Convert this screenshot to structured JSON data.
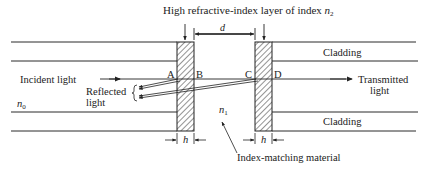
{
  "diagram": {
    "title_label": "High refractive-index layer of index",
    "title_sub_var": "n",
    "title_sub_idx": "2",
    "gap_label": "d",
    "point_labels": {
      "a": "A",
      "b": "B",
      "c": "C",
      "d": "D"
    },
    "incident_label": "Incident light",
    "reflected_label_1": "Reflected",
    "reflected_label_2": "light",
    "transmitted_label_1": "Transmitted",
    "transmitted_label_2": "light",
    "cladding_top": "Cladding",
    "cladding_bottom": "Cladding",
    "n0_var": "n",
    "n0_idx": "0",
    "n1_var": "n",
    "n1_idx": "1",
    "h_left": "h",
    "h_right": "h",
    "index_matching_label": "Index-matching material",
    "colors": {
      "line": "#2a2a2a",
      "hatch": "#3a3a3a",
      "background": "#ffffff"
    }
  }
}
